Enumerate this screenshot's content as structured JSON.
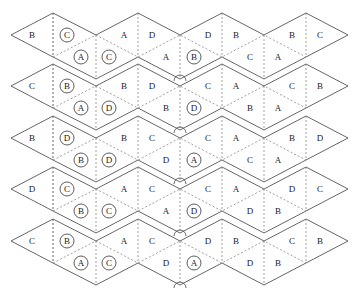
{
  "diagram": {
    "geometry": {
      "band_tip_y": [
        35,
        86,
        138,
        189,
        241
      ],
      "vertex_x": [
        11,
        53,
        96,
        138,
        180,
        222,
        264,
        306,
        348
      ],
      "half_height": 22
    },
    "bands": [
      {
        "upper": [
          {
            "x": 32,
            "t": "B",
            "c": false
          },
          {
            "x": 67,
            "t": "C",
            "c": true
          },
          {
            "x": 124,
            "t": "A",
            "c": false
          },
          {
            "x": 152,
            "t": "D",
            "c": false
          },
          {
            "x": 208,
            "t": "D",
            "c": false
          },
          {
            "x": 236,
            "t": "B",
            "c": false
          },
          {
            "x": 292,
            "t": "B",
            "c": false
          },
          {
            "x": 320,
            "t": "C",
            "c": false
          }
        ],
        "lower": [
          {
            "x": 81,
            "t": "A",
            "c": true
          },
          {
            "x": 109,
            "t": "C",
            "c": true
          },
          {
            "x": 166,
            "t": "A",
            "c": false
          },
          {
            "x": 194,
            "t": "B",
            "c": true
          },
          {
            "x": 250,
            "t": "C",
            "c": false
          },
          {
            "x": 278,
            "t": "A",
            "c": false
          }
        ]
      },
      {
        "upper": [
          {
            "x": 32,
            "t": "C",
            "c": false
          },
          {
            "x": 67,
            "t": "B",
            "c": true
          },
          {
            "x": 124,
            "t": "B",
            "c": false
          },
          {
            "x": 152,
            "t": "D",
            "c": false
          },
          {
            "x": 208,
            "t": "C",
            "c": false
          },
          {
            "x": 236,
            "t": "A",
            "c": false
          },
          {
            "x": 292,
            "t": "C",
            "c": false
          },
          {
            "x": 320,
            "t": "B",
            "c": false
          }
        ],
        "lower": [
          {
            "x": 81,
            "t": "A",
            "c": true
          },
          {
            "x": 109,
            "t": "D",
            "c": true
          },
          {
            "x": 166,
            "t": "B",
            "c": false
          },
          {
            "x": 194,
            "t": "D",
            "c": true
          },
          {
            "x": 250,
            "t": "B",
            "c": false
          },
          {
            "x": 278,
            "t": "A",
            "c": false
          }
        ]
      },
      {
        "upper": [
          {
            "x": 32,
            "t": "B",
            "c": false
          },
          {
            "x": 67,
            "t": "D",
            "c": true
          },
          {
            "x": 124,
            "t": "B",
            "c": false
          },
          {
            "x": 152,
            "t": "C",
            "c": false
          },
          {
            "x": 208,
            "t": "C",
            "c": false
          },
          {
            "x": 236,
            "t": "A",
            "c": false
          },
          {
            "x": 292,
            "t": "B",
            "c": false
          },
          {
            "x": 320,
            "t": "D",
            "c": false
          }
        ],
        "lower": [
          {
            "x": 81,
            "t": "B",
            "c": true
          },
          {
            "x": 109,
            "t": "D",
            "c": true
          },
          {
            "x": 166,
            "t": "D",
            "c": false
          },
          {
            "x": 194,
            "t": "A",
            "c": true
          },
          {
            "x": 250,
            "t": "C",
            "c": false
          },
          {
            "x": 278,
            "t": "A",
            "c": false
          }
        ]
      },
      {
        "upper": [
          {
            "x": 32,
            "t": "D",
            "c": false
          },
          {
            "x": 67,
            "t": "C",
            "c": true
          },
          {
            "x": 124,
            "t": "A",
            "c": false
          },
          {
            "x": 152,
            "t": "C",
            "c": false
          },
          {
            "x": 208,
            "t": "C",
            "c": false
          },
          {
            "x": 236,
            "t": "A",
            "c": false
          },
          {
            "x": 292,
            "t": "D",
            "c": false
          },
          {
            "x": 320,
            "t": "C",
            "c": false
          }
        ],
        "lower": [
          {
            "x": 81,
            "t": "B",
            "c": true
          },
          {
            "x": 109,
            "t": "C",
            "c": true
          },
          {
            "x": 166,
            "t": "A",
            "c": false
          },
          {
            "x": 194,
            "t": "D",
            "c": true
          },
          {
            "x": 250,
            "t": "D",
            "c": false
          },
          {
            "x": 278,
            "t": "B",
            "c": false
          }
        ]
      },
      {
        "upper": [
          {
            "x": 32,
            "t": "C",
            "c": false
          },
          {
            "x": 67,
            "t": "B",
            "c": true
          },
          {
            "x": 124,
            "t": "A",
            "c": false
          },
          {
            "x": 152,
            "t": "C",
            "c": false
          },
          {
            "x": 208,
            "t": "D",
            "c": false
          },
          {
            "x": 236,
            "t": "B",
            "c": false
          },
          {
            "x": 292,
            "t": "C",
            "c": false
          },
          {
            "x": 320,
            "t": "B",
            "c": false
          }
        ],
        "lower": [
          {
            "x": 81,
            "t": "A",
            "c": true
          },
          {
            "x": 109,
            "t": "C",
            "c": true
          },
          {
            "x": 166,
            "t": "D",
            "c": false
          },
          {
            "x": 194,
            "t": "A",
            "c": true
          },
          {
            "x": 250,
            "t": "D",
            "c": false
          },
          {
            "x": 278,
            "t": "B",
            "c": false
          }
        ]
      }
    ],
    "angle_marks": [
      {
        "x": 180,
        "y": 78
      },
      {
        "x": 180,
        "y": 130
      },
      {
        "x": 180,
        "y": 181
      },
      {
        "x": 180,
        "y": 233
      },
      {
        "x": 180,
        "y": 285
      }
    ]
  }
}
